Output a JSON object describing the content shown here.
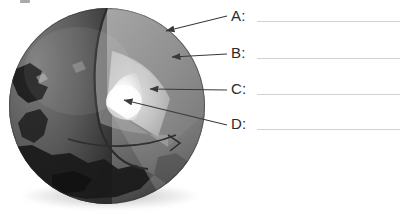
{
  "worksheet": {
    "figure_caption_remnant": "",
    "diagram_name": "earth-cutaway-cross-section",
    "labels": [
      {
        "letter": "A:",
        "answer": "",
        "target": "crust",
        "line_y": 21
      },
      {
        "letter": "B:",
        "answer": "",
        "target": "mantle",
        "line_y": 58
      },
      {
        "letter": "C:",
        "answer": "",
        "target": "outer-core",
        "line_y": 94
      },
      {
        "letter": "D:",
        "answer": "",
        "target": "inner-core",
        "line_y": 129
      }
    ]
  },
  "diagram": {
    "title": "",
    "layers": [
      {
        "name": "crust",
        "color": "#6d6d6d"
      },
      {
        "name": "mantle",
        "color": "#8e8e8e"
      },
      {
        "name": "outer-core",
        "color": "#b5b5b5"
      },
      {
        "name": "inner-core",
        "color": "#f4f4f4"
      },
      {
        "name": "ocean",
        "color": "#555555"
      },
      {
        "name": "landmass",
        "color": "#1e1e1e"
      }
    ]
  },
  "colors": {
    "background": "#ffffff",
    "text": "#2b2b2b",
    "rule": "#d2d2d2",
    "arrow": "#3a3a3a"
  }
}
